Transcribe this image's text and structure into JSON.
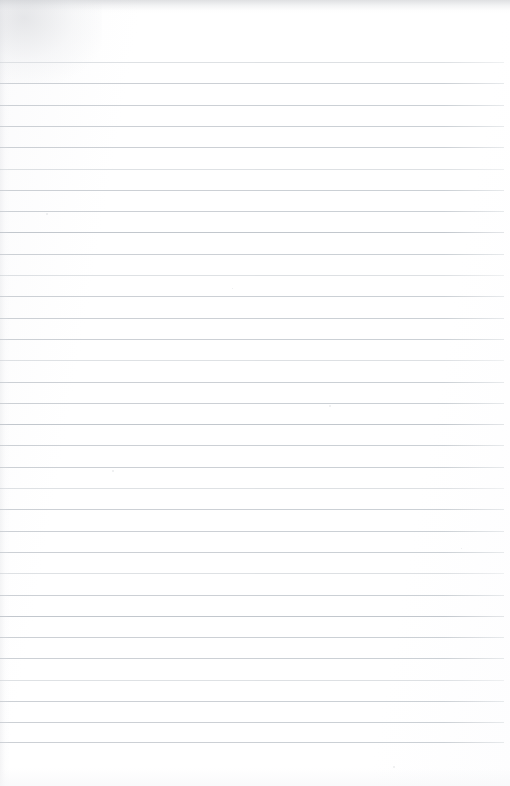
{
  "document": {
    "kind": "scanned-blank-ruled-notebook-page",
    "title": "Blank Ruled Notebook Page",
    "has_handwriting": false,
    "has_printed_text": false,
    "visible_text": "",
    "page_width_px": 510,
    "page_height_px": 786
  },
  "paper": {
    "background_color": "#ffffff",
    "tint_color": "#fbfbfc",
    "top_margin_px": 62,
    "bottom_margin_px": 44,
    "left_margin_px": 0,
    "right_margin_px": 6
  },
  "ruling": {
    "style": "horizontal-ruled",
    "line_color": "#c9ced3",
    "line_thickness_px": 1,
    "line_spacing_px": 21.3,
    "first_line_y_px": 62,
    "last_line_y_px": 742,
    "line_count": 33,
    "line_start_x_px": 0,
    "line_end_x_px": 504,
    "has_vertical_margin_rule": false,
    "lines_y": [
      62,
      83.3,
      104.6,
      125.9,
      147.2,
      168.5,
      189.8,
      211.1,
      232.4,
      253.7,
      275,
      296.3,
      317.6,
      338.9,
      360.2,
      381.5,
      402.8,
      424.1,
      445.4,
      466.7,
      488,
      509.3,
      530.6,
      551.9,
      573.2,
      594.5,
      615.8,
      637.1,
      658.4,
      679.7,
      701,
      722.3,
      742
    ],
    "line_weights": [
      "faint",
      "normal",
      "normal",
      "normal",
      "normal",
      "faint",
      "normal",
      "normal",
      "strong",
      "normal",
      "faint",
      "normal",
      "normal",
      "normal",
      "faint",
      "normal",
      "normal",
      "strong",
      "normal",
      "normal",
      "faint",
      "normal",
      "normal",
      "normal",
      "faint",
      "normal",
      "strong",
      "normal",
      "normal",
      "faint",
      "normal",
      "normal",
      "normal"
    ]
  },
  "scan_artifacts": {
    "top_edge_shadow_color": "#c4c6ca",
    "corner_smudge_color": "#c6c8cd",
    "bottom_falloff_color": "#f4f5f7",
    "speckles": [
      {
        "x": 46,
        "y": 213,
        "size": 2
      },
      {
        "x": 112,
        "y": 470,
        "size": 2
      },
      {
        "x": 329,
        "y": 405,
        "size": 2
      },
      {
        "x": 393,
        "y": 766,
        "size": 2
      },
      {
        "x": 232,
        "y": 288,
        "size": 1
      },
      {
        "x": 461,
        "y": 548,
        "size": 1
      }
    ]
  }
}
